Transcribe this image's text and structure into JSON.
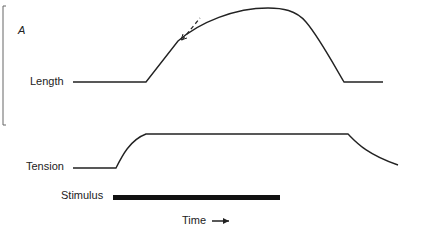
{
  "figure": {
    "panel_label": "A",
    "traces": {
      "length_label": "Length",
      "tension_label": "Tension",
      "stimulus_label": "Stimulus"
    },
    "x_axis": {
      "label": "Time",
      "arrow": "right-arrow"
    }
  },
  "colors": {
    "ink": "#222222",
    "background": "#ffffff"
  }
}
